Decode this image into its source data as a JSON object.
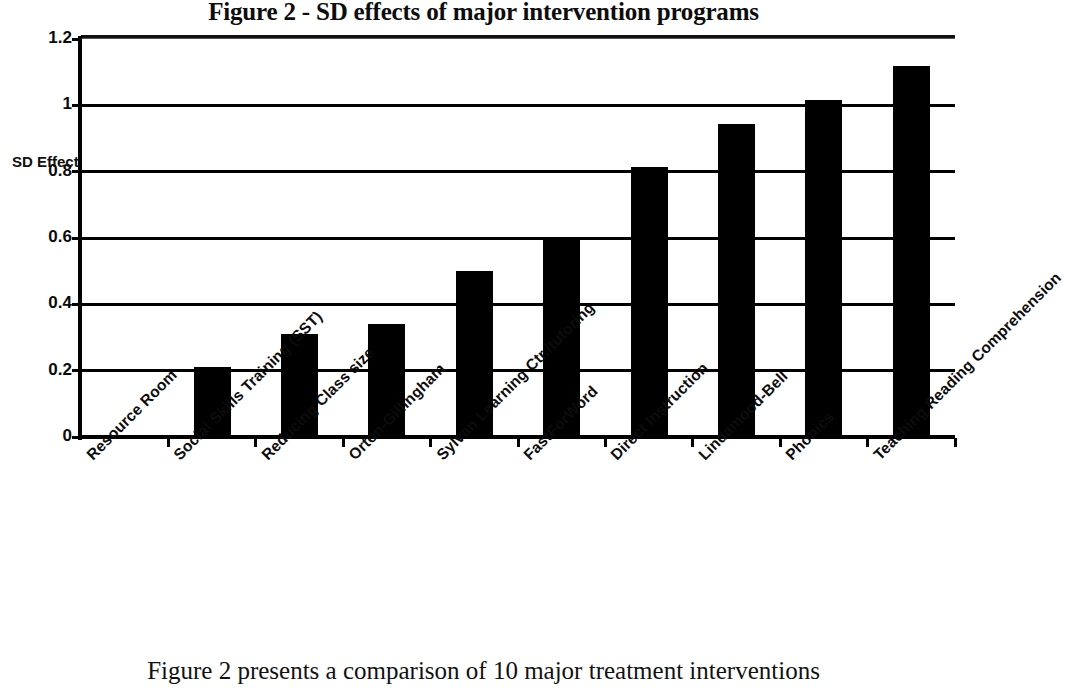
{
  "chart_data": {
    "type": "bar",
    "title": "Figure 2 - SD effects of major intervention programs",
    "xlabel": "",
    "ylabel": "SD Effect",
    "ylim": [
      0,
      1.2
    ],
    "yticks": [
      "0",
      "0.2",
      "0.4",
      "0.6",
      "0.8",
      "1",
      "1.2"
    ],
    "ytick_values": [
      0,
      0.2,
      0.4,
      0.6,
      0.8,
      1.0,
      1.2
    ],
    "grid": true,
    "legend": false,
    "bar_color": "#000000",
    "plot_background": "#ffffff",
    "categories": [
      "Resource Room",
      "Social Skills Training (SST)",
      "Reducing Class size",
      "Orton-Gillingham",
      "Sylvan Learning Ctr./tutoring",
      "FastForWord",
      "Direct Instruction",
      "Lindamood-Bell",
      "Phonics",
      "Teaching Reading Comprehension"
    ],
    "values": [
      0,
      0.21,
      0.31,
      0.34,
      0.5,
      0.6,
      0.815,
      0.945,
      1.015,
      1.12
    ]
  },
  "annotations": {
    "sd_effect": "SD Effect"
  },
  "caption": {
    "text": "Figure 2 presents a comparison of 10 major treatment interventions"
  }
}
